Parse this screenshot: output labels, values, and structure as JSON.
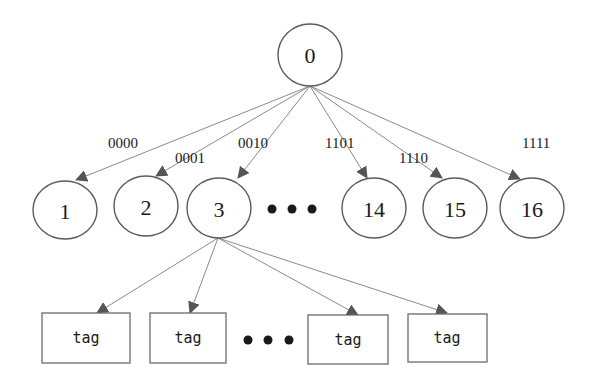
{
  "diagram": {
    "type": "tree",
    "colors": {
      "stroke": "#5a5a5a",
      "edge": "#8a8a8a",
      "arrowhead": "#555555",
      "text": "#1a1a1a",
      "background": "#ffffff"
    },
    "root": {
      "id": "0",
      "label": "0"
    },
    "children": [
      {
        "id": "1",
        "label": "1",
        "edge_label": "0000"
      },
      {
        "id": "2",
        "label": "2",
        "edge_label": "0001"
      },
      {
        "id": "3",
        "label": "3",
        "edge_label": "0010"
      },
      {
        "id": "14",
        "label": "14",
        "edge_label": "1101"
      },
      {
        "id": "15",
        "label": "15",
        "edge_label": "1110"
      },
      {
        "id": "16",
        "label": "16",
        "edge_label": "1111"
      }
    ],
    "children_ellipsis": "• • •",
    "leaf_parent": "3",
    "leaves": [
      {
        "label": "tag"
      },
      {
        "label": "tag"
      },
      {
        "label": "tag"
      },
      {
        "label": "tag"
      }
    ],
    "leaves_ellipsis": "• • •"
  }
}
